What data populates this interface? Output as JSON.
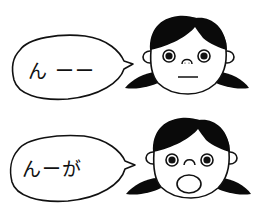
{
  "panels": [
    {
      "id": "top",
      "speech": "ん ー",
      "speech_text_visible": "ん ーー",
      "expression": "neutral-flat-mouth"
    },
    {
      "id": "bottom",
      "speech": "んーが",
      "speech_text_visible": "んーが",
      "expression": "surprised-open-mouth"
    }
  ],
  "colors": {
    "ink": "#111111",
    "hair": "#0a0a0a",
    "background": "#ffffff"
  },
  "icons": {
    "character": "girl-with-pigtails-face",
    "bubble": "speech-bubble"
  }
}
